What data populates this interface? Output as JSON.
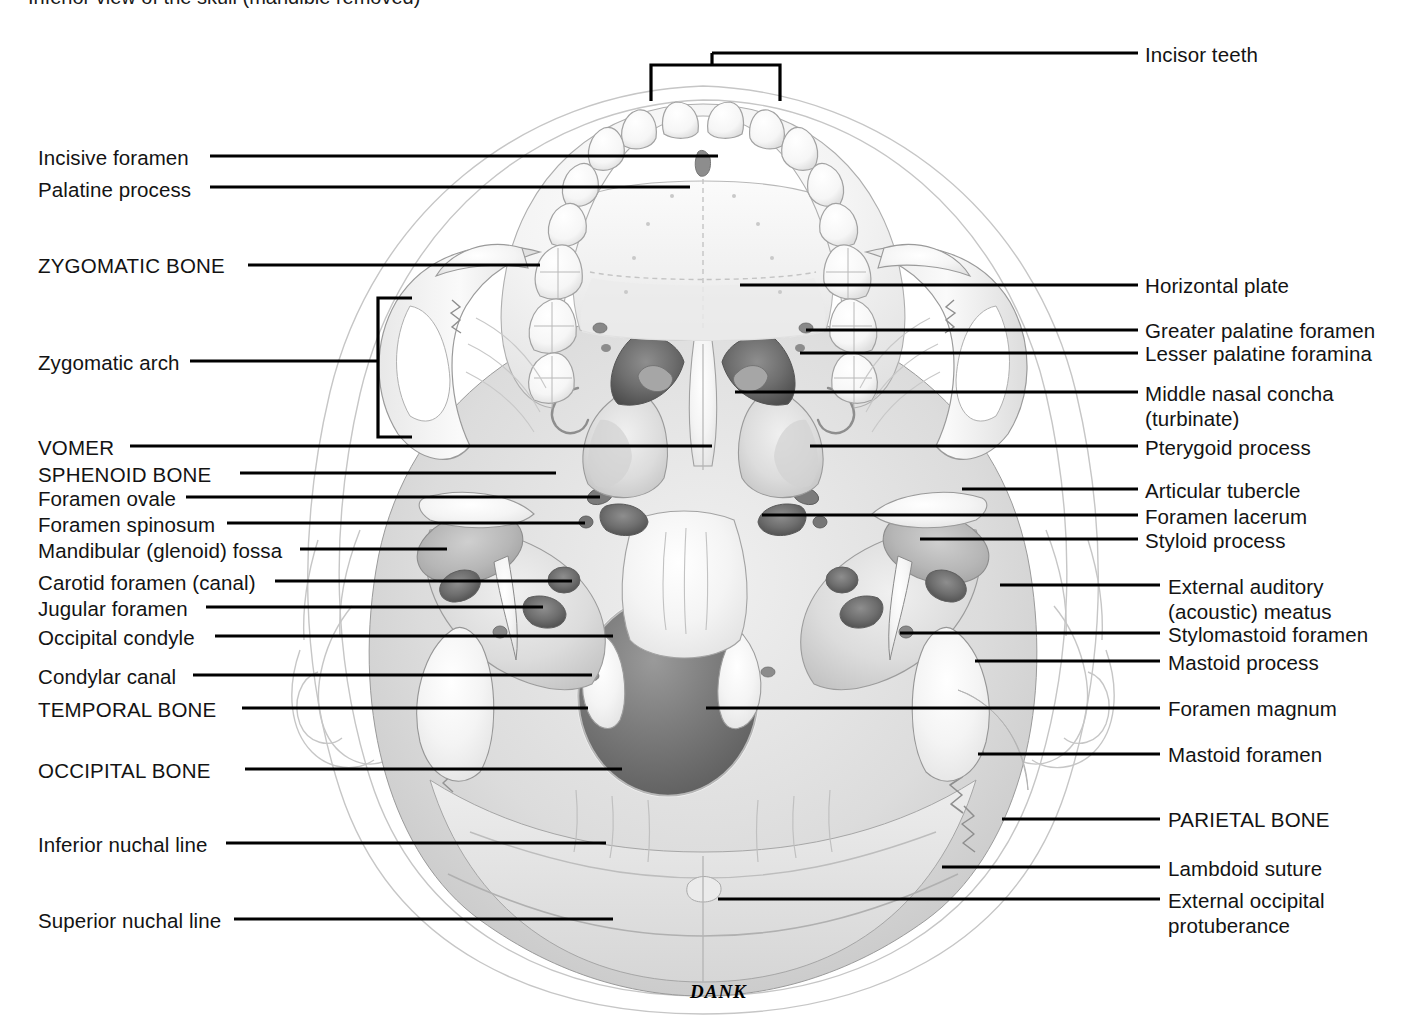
{
  "figure": {
    "title_partial": "Inferior view of the skull (mandible removed)",
    "signature": "DANK",
    "view": "inferior view of skull base, mandible removed",
    "line_color": "#000000",
    "text_color": "#131313",
    "background": "#ffffff"
  },
  "labels_left": [
    {
      "id": "incisive-foramen",
      "text": "Incisive foramen",
      "caps": false,
      "x": 38,
      "y": 145,
      "lx": 210,
      "ly": 156,
      "tx": 718,
      "ty": 156
    },
    {
      "id": "palatine-process",
      "text": "Palatine process",
      "caps": false,
      "x": 38,
      "y": 177,
      "lx": 210,
      "ly": 187,
      "tx": 690,
      "ty": 187
    },
    {
      "id": "zygomatic-bone",
      "text": "ZYGOMATIC BONE",
      "caps": true,
      "x": 38,
      "y": 253,
      "lx": 248,
      "ly": 265,
      "tx": 540,
      "ty": 265
    },
    {
      "id": "zygomatic-arch",
      "text": "Zygomatic arch",
      "caps": false,
      "x": 38,
      "y": 350,
      "lx": 190,
      "ly": 361,
      "tx": 378,
      "ty": 361
    },
    {
      "id": "vomer",
      "text": "VOMER",
      "caps": true,
      "x": 38,
      "y": 435,
      "lx": 130,
      "ly": 446,
      "tx": 712,
      "ty": 446
    },
    {
      "id": "sphenoid-bone",
      "text": "SPHENOID BONE",
      "caps": true,
      "x": 38,
      "y": 462,
      "lx": 240,
      "ly": 473,
      "tx": 556,
      "ty": 473
    },
    {
      "id": "foramen-ovale",
      "text": "Foramen ovale",
      "caps": false,
      "x": 38,
      "y": 486,
      "lx": 186,
      "ly": 497,
      "tx": 600,
      "ty": 497
    },
    {
      "id": "foramen-spinosum",
      "text": "Foramen spinosum",
      "caps": false,
      "x": 38,
      "y": 512,
      "lx": 227,
      "ly": 523,
      "tx": 585,
      "ty": 523
    },
    {
      "id": "mandibular-fossa",
      "text": "Mandibular (glenoid) fossa",
      "caps": false,
      "x": 38,
      "y": 538,
      "lx": 300,
      "ly": 549,
      "tx": 447,
      "ty": 549
    },
    {
      "id": "carotid-foramen",
      "text": "Carotid foramen (canal)",
      "caps": false,
      "x": 38,
      "y": 570,
      "lx": 275,
      "ly": 581,
      "tx": 572,
      "ty": 581
    },
    {
      "id": "jugular-foramen",
      "text": "Jugular foramen",
      "caps": false,
      "x": 38,
      "y": 596,
      "lx": 206,
      "ly": 607,
      "tx": 543,
      "ty": 607
    },
    {
      "id": "occipital-condyle",
      "text": "Occipital condyle",
      "caps": false,
      "x": 38,
      "y": 625,
      "lx": 215,
      "ly": 636,
      "tx": 613,
      "ty": 636
    },
    {
      "id": "condylar-canal",
      "text": "Condylar canal",
      "caps": false,
      "x": 38,
      "y": 664,
      "lx": 193,
      "ly": 675,
      "tx": 592,
      "ty": 675
    },
    {
      "id": "temporal-bone",
      "text": "TEMPORAL BONE",
      "caps": true,
      "x": 38,
      "y": 697,
      "lx": 242,
      "ly": 708,
      "tx": 588,
      "ty": 708
    },
    {
      "id": "occipital-bone",
      "text": "OCCIPITAL BONE",
      "caps": true,
      "x": 38,
      "y": 758,
      "lx": 245,
      "ly": 769,
      "tx": 622,
      "ty": 769
    },
    {
      "id": "inferior-nuchal",
      "text": "Inferior nuchal line",
      "caps": false,
      "x": 38,
      "y": 832,
      "lx": 226,
      "ly": 843,
      "tx": 606,
      "ty": 843
    },
    {
      "id": "superior-nuchal",
      "text": "Superior nuchal line",
      "caps": false,
      "x": 38,
      "y": 908,
      "lx": 234,
      "ly": 919,
      "tx": 613,
      "ty": 919
    }
  ],
  "labels_right": [
    {
      "id": "incisor-teeth",
      "text": "Incisor teeth",
      "line2": "",
      "caps": false,
      "x": 1145,
      "y": 42,
      "lx": 1138,
      "ly": 53,
      "tx": 712,
      "ty": 53
    },
    {
      "id": "horizontal-plate",
      "text": "Horizontal plate",
      "line2": "",
      "caps": false,
      "x": 1145,
      "y": 273,
      "lx": 1138,
      "ly": 285,
      "tx": 740,
      "ty": 285
    },
    {
      "id": "greater-palatine",
      "text": "Greater palatine foramen",
      "line2": "",
      "caps": false,
      "x": 1145,
      "y": 318,
      "lx": 1138,
      "ly": 330,
      "tx": 806,
      "ty": 330
    },
    {
      "id": "lesser-palatine",
      "text": "Lesser palatine foramina",
      "line2": "",
      "caps": false,
      "x": 1145,
      "y": 341,
      "lx": 1138,
      "ly": 353,
      "tx": 800,
      "ty": 353
    },
    {
      "id": "middle-nasal-concha",
      "text": "Middle nasal concha",
      "line2": "(turbinate)",
      "caps": false,
      "x": 1145,
      "y": 381,
      "lx": 1138,
      "ly": 392,
      "tx": 735,
      "ty": 392
    },
    {
      "id": "pterygoid-process",
      "text": "Pterygoid process",
      "line2": "",
      "caps": false,
      "x": 1145,
      "y": 435,
      "lx": 1138,
      "ly": 446,
      "tx": 810,
      "ty": 446
    },
    {
      "id": "articular-tubercle",
      "text": "Articular tubercle",
      "line2": "",
      "caps": false,
      "x": 1145,
      "y": 478,
      "lx": 1138,
      "ly": 489,
      "tx": 962,
      "ty": 489
    },
    {
      "id": "foramen-lacerum",
      "text": "Foramen lacerum",
      "line2": "",
      "caps": false,
      "x": 1145,
      "y": 504,
      "lx": 1138,
      "ly": 515,
      "tx": 762,
      "ty": 515
    },
    {
      "id": "styloid-process",
      "text": "Styloid process",
      "line2": "",
      "caps": false,
      "x": 1145,
      "y": 528,
      "lx": 1138,
      "ly": 539,
      "tx": 920,
      "ty": 539
    },
    {
      "id": "external-auditory",
      "text": "External auditory",
      "line2": "(acoustic) meatus",
      "caps": false,
      "x": 1168,
      "y": 574,
      "lx": 1160,
      "ly": 585,
      "tx": 1000,
      "ty": 585
    },
    {
      "id": "stylomastoid-foramen",
      "text": "Stylomastoid foramen",
      "line2": "",
      "caps": false,
      "x": 1168,
      "y": 622,
      "lx": 1160,
      "ly": 633,
      "tx": 900,
      "ty": 633
    },
    {
      "id": "mastoid-process",
      "text": "Mastoid process",
      "line2": "",
      "caps": false,
      "x": 1168,
      "y": 650,
      "lx": 1160,
      "ly": 661,
      "tx": 975,
      "ty": 661
    },
    {
      "id": "foramen-magnum",
      "text": "Foramen magnum",
      "line2": "",
      "caps": false,
      "x": 1168,
      "y": 696,
      "lx": 1160,
      "ly": 708,
      "tx": 706,
      "ty": 708
    },
    {
      "id": "mastoid-foramen",
      "text": "Mastoid foramen",
      "line2": "",
      "caps": false,
      "x": 1168,
      "y": 742,
      "lx": 1160,
      "ly": 754,
      "tx": 978,
      "ty": 754
    },
    {
      "id": "parietal-bone",
      "text": "PARIETAL BONE",
      "line2": "",
      "caps": true,
      "x": 1168,
      "y": 807,
      "lx": 1160,
      "ly": 819,
      "tx": 1002,
      "ty": 819
    },
    {
      "id": "lambdoid-suture",
      "text": "Lambdoid suture",
      "line2": "",
      "caps": false,
      "x": 1168,
      "y": 856,
      "lx": 1160,
      "ly": 867,
      "tx": 942,
      "ty": 867
    },
    {
      "id": "external-occipital",
      "text": "External occipital",
      "line2": "protuberance",
      "caps": false,
      "x": 1168,
      "y": 888,
      "lx": 1160,
      "ly": 899,
      "tx": 718,
      "ty": 899
    }
  ],
  "brackets": [
    {
      "id": "incisor-teeth-bracket",
      "orientation": "down",
      "x1": 651,
      "x2": 780,
      "y": 65,
      "depth": 36,
      "stem_x": 712,
      "stem_y": 53
    },
    {
      "id": "zygomatic-arch-bracket",
      "orientation": "left",
      "y1": 298,
      "y2": 437,
      "x": 378,
      "depth": 34,
      "stem_y": 361
    }
  ]
}
